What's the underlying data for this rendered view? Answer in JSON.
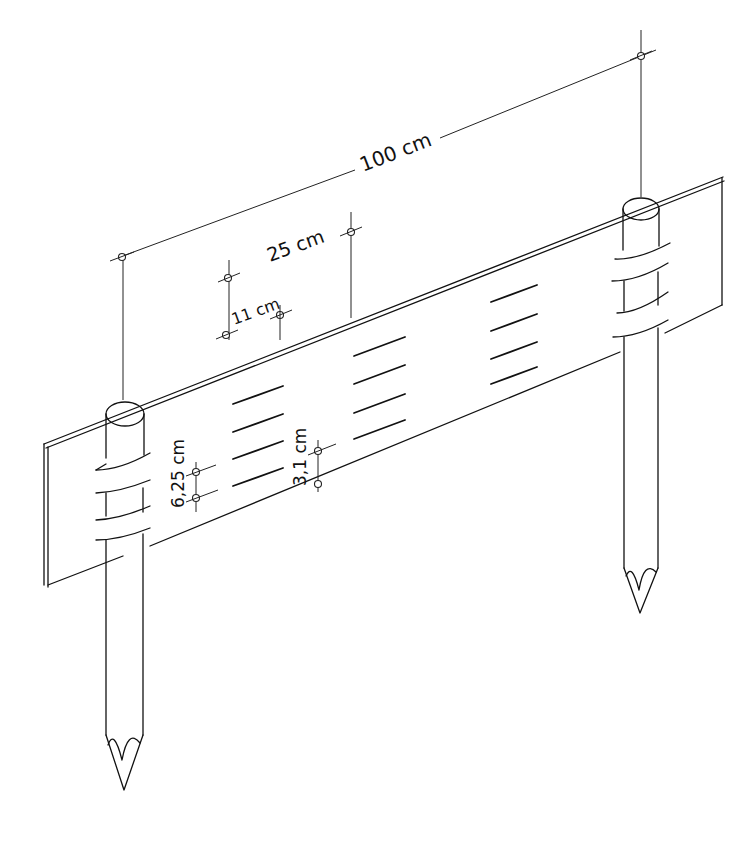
{
  "diagram": {
    "background": "#ffffff",
    "ink": "#111111",
    "labels": {
      "total_width": "100 cm",
      "slot_spacing": "25 cm",
      "slot_length": "11 cm",
      "board_edge_offset": "6,25 cm",
      "slot_pitch": "3,1 cm"
    },
    "slot_columns": 4,
    "slots_per_column": 4,
    "stakes": 2
  }
}
